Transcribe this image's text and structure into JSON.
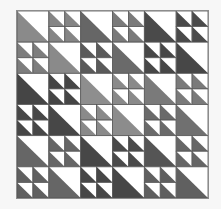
{
  "grid": {
    "rows": 6,
    "cols": 6
  },
  "palette": {
    "background": "#ffffff",
    "line": "#555555",
    "border": "#8c8c8c"
  },
  "blocks": [
    [
      {
        "type": "big",
        "color": "#8a8a8a"
      },
      {
        "type": "small",
        "color": "#858585"
      },
      {
        "type": "big",
        "color": "#666666"
      },
      {
        "type": "small",
        "color": "#7a7a7a"
      },
      {
        "type": "big",
        "color": "#4a4a4a"
      },
      {
        "type": "small",
        "color": "#4a4a4a"
      }
    ],
    [
      {
        "type": "small",
        "color": "#7d7d7d"
      },
      {
        "type": "big",
        "color": "#8a8a8a"
      },
      {
        "type": "small",
        "color": "#5a5a5a"
      },
      {
        "type": "big",
        "color": "#6a6a6a"
      },
      {
        "type": "small",
        "color": "#474747"
      },
      {
        "type": "big",
        "color": "#474747"
      }
    ],
    [
      {
        "type": "big",
        "color": "#454545"
      },
      {
        "type": "small",
        "color": "#454545"
      },
      {
        "type": "big",
        "color": "#8e8e8e"
      },
      {
        "type": "small",
        "color": "#8a8a8a"
      },
      {
        "type": "big",
        "color": "#7a7a7a"
      },
      {
        "type": "small",
        "color": "#7a7a7a"
      }
    ],
    [
      {
        "type": "small",
        "color": "#474747"
      },
      {
        "type": "big",
        "color": "#474747"
      },
      {
        "type": "small",
        "color": "#8a8a8a"
      },
      {
        "type": "big",
        "color": "#8c8c8c"
      },
      {
        "type": "small",
        "color": "#6a6a6a"
      },
      {
        "type": "big",
        "color": "#707070"
      }
    ],
    [
      {
        "type": "big",
        "color": "#666666"
      },
      {
        "type": "small",
        "color": "#666666"
      },
      {
        "type": "big",
        "color": "#474747"
      },
      {
        "type": "small",
        "color": "#4a4a4a"
      },
      {
        "type": "big",
        "color": "#555555"
      },
      {
        "type": "small",
        "color": "#666666"
      }
    ],
    [
      {
        "type": "small",
        "color": "#606060"
      },
      {
        "type": "big",
        "color": "#666666"
      },
      {
        "type": "small",
        "color": "#474747"
      },
      {
        "type": "big",
        "color": "#474747"
      },
      {
        "type": "small",
        "color": "#5f5f5f"
      },
      {
        "type": "big",
        "color": "#606060"
      }
    ]
  ]
}
